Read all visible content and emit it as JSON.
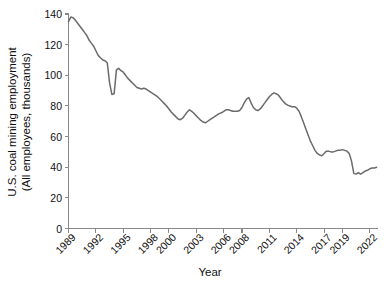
{
  "chart_data": {
    "type": "line",
    "title": "",
    "xlabel": "Year",
    "ylabel": "U.S. coal mining employment (All employees, thousands)",
    "ylabel_line1": "U.S. coal mining employment",
    "ylabel_line2": "(All employees, thousands)",
    "xlim": [
      1989.0,
      2022.9
    ],
    "ylim": [
      0,
      140
    ],
    "yticks": [
      0,
      20,
      40,
      60,
      80,
      100,
      120,
      140
    ],
    "ytick_labels": [
      "0",
      "20",
      "40",
      "60",
      "80",
      "100",
      "120",
      "140"
    ],
    "xticks": [
      1989,
      1992,
      1995,
      1998,
      2000,
      2003,
      2006,
      2008,
      2011,
      2014,
      2017,
      2019,
      2022
    ],
    "xtick_labels": [
      "1989",
      "1992",
      "1995",
      "1998",
      "2000",
      "2003",
      "2006",
      "2008",
      "2011",
      "2014",
      "2017",
      "2019",
      "2022"
    ],
    "grid": false,
    "legend": "none",
    "series_color": "#6b6b6b",
    "series": [
      {
        "name": "U.S. coal mining employment",
        "x": [
          1989.0,
          1989.25,
          1989.5,
          1989.75,
          1990.0,
          1990.25,
          1990.5,
          1990.75,
          1991.0,
          1991.25,
          1991.5,
          1991.75,
          1992.0,
          1992.25,
          1992.5,
          1992.75,
          1993.0,
          1993.25,
          1993.5,
          1993.75,
          1994.0,
          1994.25,
          1994.5,
          1994.75,
          1995.0,
          1995.25,
          1995.5,
          1995.75,
          1996.0,
          1996.25,
          1996.5,
          1996.75,
          1997.0,
          1997.25,
          1997.5,
          1997.75,
          1998.0,
          1998.25,
          1998.5,
          1998.75,
          1999.0,
          1999.25,
          1999.5,
          1999.75,
          2000.0,
          2000.25,
          2000.5,
          2000.75,
          2001.0,
          2001.25,
          2001.5,
          2001.75,
          2002.0,
          2002.25,
          2002.5,
          2002.75,
          2003.0,
          2003.25,
          2003.5,
          2003.75,
          2004.0,
          2004.25,
          2004.5,
          2004.75,
          2005.0,
          2005.25,
          2005.5,
          2005.75,
          2006.0,
          2006.25,
          2006.5,
          2006.75,
          2007.0,
          2007.25,
          2007.5,
          2007.75,
          2008.0,
          2008.25,
          2008.5,
          2008.75,
          2009.0,
          2009.25,
          2009.5,
          2009.75,
          2010.0,
          2010.25,
          2010.5,
          2010.75,
          2011.0,
          2011.25,
          2011.5,
          2011.75,
          2012.0,
          2012.25,
          2012.5,
          2012.75,
          2013.0,
          2013.25,
          2013.5,
          2013.75,
          2014.0,
          2014.25,
          2014.5,
          2014.75,
          2015.0,
          2015.25,
          2015.5,
          2015.75,
          2016.0,
          2016.25,
          2016.5,
          2016.75,
          2017.0,
          2017.25,
          2017.5,
          2017.75,
          2018.0,
          2018.25,
          2018.5,
          2018.75,
          2019.0,
          2019.25,
          2019.5,
          2019.75,
          2020.0,
          2020.25,
          2020.5,
          2020.75,
          2021.0,
          2021.25,
          2021.5,
          2021.75,
          2022.0,
          2022.25,
          2022.5,
          2022.75
        ],
        "values": [
          135.0,
          138.0,
          137.5,
          136.0,
          134.0,
          132.0,
          130.0,
          128.0,
          126.0,
          123.0,
          121.0,
          119.0,
          116.0,
          113.0,
          111.5,
          110.0,
          109.5,
          108.0,
          95.0,
          87.5,
          88.0,
          103.5,
          104.5,
          103.0,
          102.0,
          100.0,
          98.0,
          96.5,
          95.0,
          93.5,
          92.0,
          91.5,
          91.0,
          91.5,
          91.0,
          90.0,
          89.0,
          88.0,
          87.0,
          86.0,
          84.5,
          83.0,
          81.5,
          80.0,
          78.0,
          76.0,
          74.5,
          73.0,
          71.5,
          71.0,
          72.0,
          74.0,
          76.0,
          77.5,
          76.5,
          75.0,
          73.5,
          72.0,
          70.5,
          69.5,
          69.0,
          70.0,
          71.0,
          72.0,
          73.0,
          74.0,
          75.0,
          75.5,
          76.5,
          77.5,
          77.5,
          77.0,
          76.5,
          76.5,
          76.5,
          77.0,
          79.0,
          82.0,
          84.5,
          85.5,
          82.0,
          79.0,
          77.5,
          77.0,
          78.0,
          80.0,
          82.0,
          84.0,
          86.0,
          87.5,
          88.5,
          88.0,
          87.0,
          85.0,
          83.0,
          81.5,
          80.5,
          80.0,
          79.5,
          79.5,
          78.5,
          76.5,
          73.0,
          69.0,
          65.0,
          61.0,
          57.0,
          54.0,
          51.0,
          49.0,
          48.0,
          47.5,
          49.0,
          50.5,
          50.5,
          50.0,
          50.0,
          50.5,
          51.0,
          51.0,
          51.5,
          51.0,
          50.5,
          49.0,
          44.0,
          36.0,
          35.5,
          36.5,
          35.5,
          36.5,
          37.5,
          38.0,
          39.0,
          39.5,
          39.5,
          40.0
        ]
      }
    ]
  },
  "axis_labels": {
    "x_title": "Year",
    "y_title_line1": "U.S. coal mining employment",
    "y_title_line2": "(All employees, thousands)"
  }
}
